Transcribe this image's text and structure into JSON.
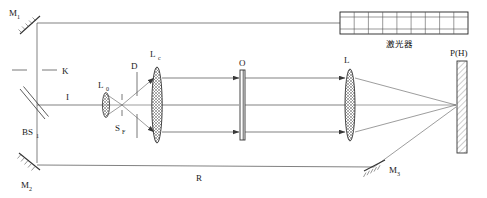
{
  "diagram": {
    "background_color": "#ffffff",
    "line_color": "#4a4a4a"
  },
  "labels": {
    "mirror1": "M",
    "mirror1_sub": "1",
    "mirror2": "M",
    "mirror2_sub": "2",
    "mirror3": "M",
    "mirror3_sub": "3",
    "beamsplitter": "BS",
    "beamsplitter_sub": "1",
    "shutter": "K",
    "object_beam": "I",
    "lens0": "L",
    "lens0_sub": "0",
    "spatial_filter": "S",
    "spatial_filter_sub": "F",
    "aperture": "D",
    "collimator": "L",
    "collimator_sub": "c",
    "object": "O",
    "lens": "L",
    "plate": "P(H)",
    "reference_beam": "R",
    "laser": "激光器"
  },
  "components": [
    {
      "name": "mirror-m1",
      "label": "M1",
      "type": "mirror",
      "x": 30,
      "y": 24
    },
    {
      "name": "mirror-m2",
      "label": "M2",
      "type": "mirror",
      "x": 30,
      "y": 163
    },
    {
      "name": "mirror-m3",
      "label": "M3",
      "type": "mirror",
      "x": 366,
      "y": 166
    },
    {
      "name": "beam-splitter-bs1",
      "label": "BS1",
      "type": "beamsplitter",
      "x": 30,
      "y": 105
    },
    {
      "name": "shutter-k",
      "label": "K",
      "type": "shutter",
      "x": 30,
      "y": 70
    },
    {
      "name": "lens-l0",
      "label": "L0",
      "type": "lens",
      "x": 106,
      "y": 105
    },
    {
      "name": "spatial-filter-sf",
      "label": "SF",
      "type": "pinhole",
      "x": 121,
      "y": 105
    },
    {
      "name": "aperture-d",
      "label": "D",
      "type": "aperture",
      "x": 134,
      "y": 105
    },
    {
      "name": "collimating-lens-lc",
      "label": "Lc",
      "type": "lens",
      "x": 156,
      "y": 105
    },
    {
      "name": "object-o",
      "label": "O",
      "type": "object-plate",
      "x": 242,
      "y": 105
    },
    {
      "name": "imaging-lens-l",
      "label": "L",
      "type": "lens",
      "x": 350,
      "y": 105
    },
    {
      "name": "holographic-plate-ph",
      "label": "P(H)",
      "type": "plate",
      "x": 463,
      "y": 105
    },
    {
      "name": "laser-source",
      "label": "激光器",
      "type": "laser",
      "x": 400,
      "y": 25
    }
  ],
  "laser_box": {
    "cells": 9,
    "rows": 2,
    "caption": "激光器"
  }
}
